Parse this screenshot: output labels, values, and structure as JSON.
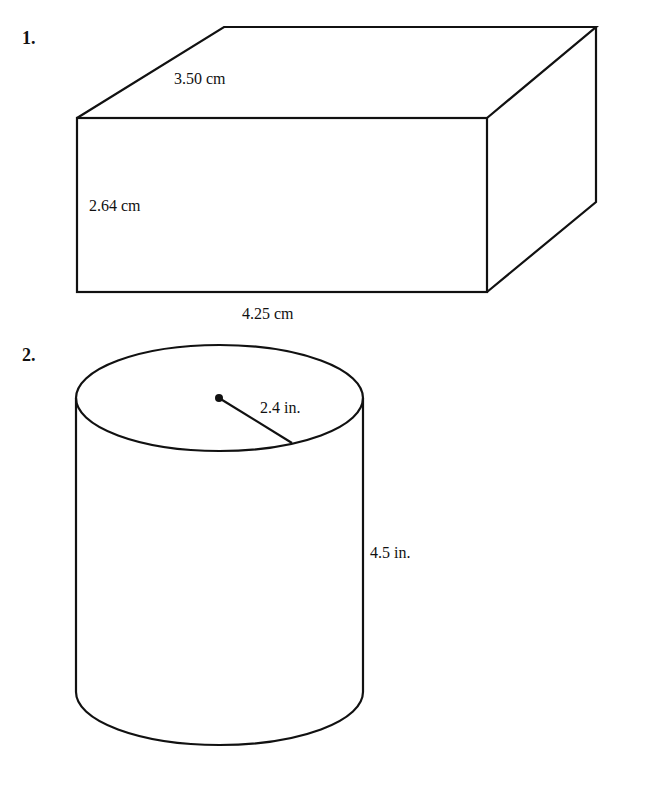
{
  "problems": [
    {
      "number": "1.",
      "shape": "rectangular-prism",
      "labels": {
        "depth": "3.50 cm",
        "height": "2.64 cm",
        "length": "4.25 cm"
      }
    },
    {
      "number": "2.",
      "shape": "cylinder",
      "labels": {
        "radius": "2.4 in.",
        "height": "4.5 in."
      }
    }
  ]
}
